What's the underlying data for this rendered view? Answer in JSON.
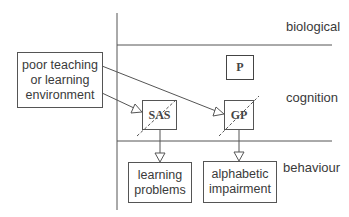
{
  "diagram": {
    "levels": {
      "biological": "biological",
      "cognition": "cognition",
      "behaviour": "behaviour"
    },
    "nodes": {
      "environment": {
        "line1": "poor teaching",
        "line2": "or learning",
        "line3": "environment"
      },
      "sas": "SAS",
      "p": "P",
      "gp": "GP",
      "learning_problems": {
        "line1": "learning",
        "line2": "problems"
      },
      "alphabetic_impairment": {
        "line1": "alphabetic",
        "line2": "impairment"
      }
    },
    "edges": [
      {
        "from": "environment",
        "to": "gp"
      },
      {
        "from": "environment",
        "to": "sas"
      },
      {
        "from": "sas",
        "to": "learning_problems"
      },
      {
        "from": "gp",
        "to": "alphabetic_impairment"
      }
    ],
    "colors": {
      "line": "#555555",
      "text": "#3a3a3a",
      "background": "#ffffff"
    }
  }
}
